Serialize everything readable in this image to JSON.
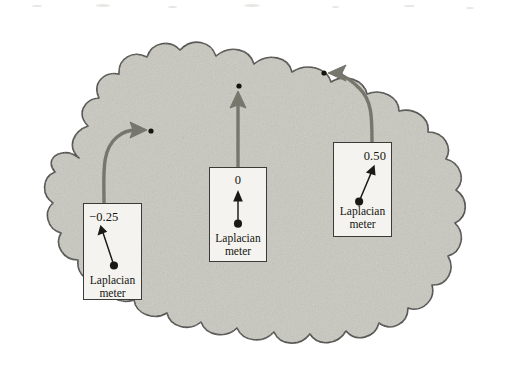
{
  "figure": {
    "region_fill_color": "#c9c8c0",
    "region_outline_color": "#3a3a36",
    "arrow_color": "#76766d",
    "needle_color": "#1a1a14",
    "point_color": "#15150f",
    "meter_body_color": "#f4f3ef"
  },
  "meters": [
    {
      "id": "meter-left",
      "reading": "−0.25",
      "reading_value": -0.25,
      "caption_line1": "Laplacian",
      "caption_line2": "meter",
      "needle_direction": "up-left",
      "arrow_shape": "curve-right",
      "box": {
        "x": 83,
        "y": 203,
        "w": 59,
        "h": 97
      },
      "target_point": {
        "x": 151,
        "y": 131
      }
    },
    {
      "id": "meter-center",
      "reading": "0",
      "reading_value": 0,
      "caption_line1": "Laplacian",
      "caption_line2": "meter",
      "needle_direction": "up",
      "arrow_shape": "straight-up",
      "box": {
        "x": 209,
        "y": 167,
        "w": 58,
        "h": 95
      },
      "target_point": {
        "x": 239,
        "y": 86
      }
    },
    {
      "id": "meter-right",
      "reading": "0.50",
      "reading_value": 0.5,
      "caption_line1": "Laplacian",
      "caption_line2": "meter",
      "needle_direction": "up-right",
      "arrow_shape": "curve-left",
      "box": {
        "x": 333,
        "y": 142,
        "w": 59,
        "h": 95
      },
      "target_point": {
        "x": 324,
        "y": 73
      }
    }
  ]
}
